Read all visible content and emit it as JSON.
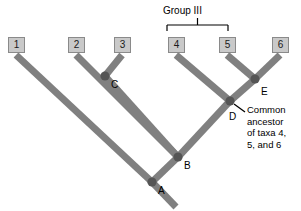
{
  "figure": {
    "type": "phylogenetic-tree",
    "background_color": "#ffffff",
    "branch_color": "#808080",
    "node_color": "#555555",
    "box_fill_color": "#c9c9c9",
    "box_border_color": "#8a8a8a",
    "text_color": "#000000"
  },
  "taxa": [
    {
      "label": "1",
      "x": 8,
      "y": 37
    },
    {
      "label": "2",
      "x": 68,
      "y": 37
    },
    {
      "label": "3",
      "x": 114,
      "y": 37
    },
    {
      "label": "4",
      "x": 168,
      "y": 37
    },
    {
      "label": "5",
      "x": 219,
      "y": 37
    },
    {
      "label": "6",
      "x": 272,
      "y": 37
    }
  ],
  "nodes": [
    {
      "label": "A",
      "x": 152,
      "y": 182,
      "label_x": 158,
      "label_y": 186
    },
    {
      "label": "B",
      "x": 178,
      "y": 157,
      "label_x": 184,
      "label_y": 161
    },
    {
      "label": "C",
      "x": 105,
      "y": 76,
      "label_x": 111,
      "label_y": 80
    },
    {
      "label": "D",
      "x": 230,
      "y": 101,
      "label_x": 229,
      "label_y": 112
    },
    {
      "label": "E",
      "x": 255,
      "y": 79,
      "label_x": 261,
      "label_y": 87
    }
  ],
  "group": {
    "label": "Group III",
    "label_x": 163,
    "label_y": 5,
    "bracket_left": 167,
    "bracket_right": 228,
    "bracket_y": 25,
    "bracket_tick_top": 18,
    "spans_taxa": [
      "4",
      "5"
    ]
  },
  "annotation": {
    "lines": [
      "Common",
      "ancestor",
      "of taxa 4,",
      "5, and 6"
    ],
    "x": 247,
    "y": 104,
    "leader_from_x": 234,
    "leader_from_y": 104,
    "leader_to_x": 245,
    "leader_to_y": 112
  },
  "branches": [
    {
      "name": "taxon-1-branch",
      "x1": 16,
      "y1": 55,
      "x2": 152,
      "y2": 182
    },
    {
      "name": "taxon-2-branch",
      "x1": 76,
      "y1": 55,
      "x2": 178,
      "y2": 157
    },
    {
      "name": "taxon-3-branch",
      "x1": 122,
      "y1": 55,
      "x2": 105,
      "y2": 76
    },
    {
      "name": "node-c-to-b",
      "x1": 105,
      "y1": 76,
      "x2": 178,
      "y2": 157
    },
    {
      "name": "taxon-4-branch",
      "x1": 176,
      "y1": 55,
      "x2": 230,
      "y2": 101
    },
    {
      "name": "taxon-5-branch",
      "x1": 227,
      "y1": 55,
      "x2": 255,
      "y2": 79
    },
    {
      "name": "taxon-6-branch",
      "x1": 280,
      "y1": 55,
      "x2": 255,
      "y2": 79
    },
    {
      "name": "node-e-to-d",
      "x1": 255,
      "y1": 79,
      "x2": 230,
      "y2": 101
    },
    {
      "name": "node-d-to-b",
      "x1": 230,
      "y1": 101,
      "x2": 178,
      "y2": 157
    },
    {
      "name": "node-b-to-a",
      "x1": 178,
      "y1": 157,
      "x2": 152,
      "y2": 182
    },
    {
      "name": "root-stem",
      "x1": 152,
      "y1": 182,
      "x2": 176,
      "y2": 207
    }
  ]
}
